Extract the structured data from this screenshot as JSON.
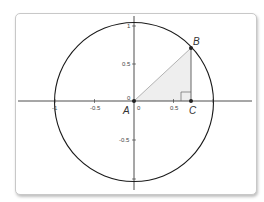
{
  "diagram": {
    "type": "unit-circle",
    "colors": {
      "axis": "#222222",
      "circle": "#1a1a1a",
      "triangle_fill": "#eeeeee",
      "hypotenuse": "#aaaaaa",
      "leg": "#555555",
      "point": "#222222"
    },
    "x_ticks": [
      {
        "label": "-1",
        "value": -1
      },
      {
        "label": "-0.5",
        "value": -0.5
      },
      {
        "label": "0",
        "value": 0
      },
      {
        "label": "0.5",
        "value": 0.5
      }
    ],
    "y_ticks": [
      {
        "label": "1",
        "value": 1
      },
      {
        "label": "0.5",
        "value": 0.5
      },
      {
        "label": "0",
        "value": 0
      },
      {
        "label": "-0.5",
        "value": -0.5
      }
    ],
    "points": {
      "A": {
        "label": "A",
        "x": 0,
        "y": 0
      },
      "B": {
        "label": "B",
        "x": 0.71,
        "y": 0.71
      },
      "C": {
        "label": "C",
        "x": 0.71,
        "y": 0
      }
    },
    "circle": {
      "center": [
        0,
        0
      ],
      "radius": 1
    }
  }
}
